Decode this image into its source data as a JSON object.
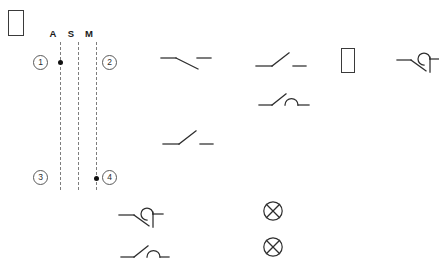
{
  "diagram": {
    "background_color": "#ffffff",
    "line_color": "#2e2e2e",
    "dashed_line_color": "#7d7d7d",
    "dot_color": "#111111"
  },
  "tofu_boxes": [
    {
      "name": "tofu-box-top-left",
      "x": 8,
      "y": 10,
      "w": 16,
      "h": 26
    },
    {
      "name": "tofu-box-center-right",
      "x": 341,
      "y": 48,
      "w": 14,
      "h": 25
    }
  ],
  "bus": {
    "column_labels": [
      {
        "text": "A",
        "x": 53,
        "y": 29
      },
      {
        "text": "S",
        "x": 71,
        "y": 29
      },
      {
        "text": "M",
        "x": 89,
        "y": 29
      }
    ],
    "lines": [
      {
        "name": "vertical-line-a",
        "x": 60,
        "y_top": 42,
        "y_bottom": 190
      },
      {
        "name": "vertical-line-s",
        "x": 78,
        "y_top": 42,
        "y_bottom": 190
      },
      {
        "name": "vertical-line-m",
        "x": 96,
        "y_top": 42,
        "y_bottom": 190
      }
    ],
    "junction_dots": [
      {
        "name": "junction-dot-a-top",
        "x": 60,
        "y": 62
      },
      {
        "name": "junction-dot-m-bottom",
        "x": 96,
        "y": 178
      }
    ],
    "callouts": [
      {
        "label": "1",
        "name": "callout-1",
        "x": 33,
        "y": 55
      },
      {
        "label": "2",
        "name": "callout-2",
        "x": 102,
        "y": 55
      },
      {
        "label": "3",
        "name": "callout-3",
        "x": 33,
        "y": 170
      },
      {
        "label": "4",
        "name": "callout-4",
        "x": 102,
        "y": 170
      }
    ]
  },
  "symbols": [
    {
      "name": "switch-normally-closed-1",
      "kind": "switch-normally-closed",
      "x": 160,
      "y": 50,
      "w": 48,
      "h": 24
    },
    {
      "name": "switch-normally-open-1",
      "kind": "switch-normally-open",
      "x": 255,
      "y": 48,
      "w": 48,
      "h": 24
    },
    {
      "name": "switch-limit-arc-1",
      "kind": "switch-limit-arc",
      "x": 258,
      "y": 88,
      "w": 48,
      "h": 22
    },
    {
      "name": "switch-normally-open-2",
      "kind": "switch-normally-open",
      "x": 162,
      "y": 126,
      "w": 48,
      "h": 24
    },
    {
      "name": "switch-arrow-actuator-1",
      "kind": "switch-arrow-actuator",
      "x": 396,
      "y": 52,
      "w": 42,
      "h": 24
    },
    {
      "name": "switch-arrow-actuator-2",
      "kind": "switch-arrow-actuator",
      "x": 118,
      "y": 207,
      "w": 44,
      "h": 24
    },
    {
      "name": "switch-limit-arc-2",
      "kind": "switch-limit-arc",
      "x": 120,
      "y": 240,
      "w": 46,
      "h": 22
    },
    {
      "name": "indicator-lamp-1",
      "kind": "lamp-cross-circle",
      "x": 262,
      "y": 200,
      "w": 20,
      "h": 20
    },
    {
      "name": "indicator-lamp-2",
      "kind": "lamp-cross-circle",
      "x": 262,
      "y": 236,
      "w": 20,
      "h": 20
    }
  ]
}
